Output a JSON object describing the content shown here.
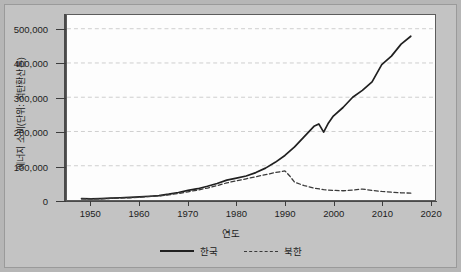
{
  "chart_data": {
    "type": "line",
    "title": "",
    "xlabel": "연도",
    "ylabel": "에너지 소비(단위: 석탄환산톤)",
    "xlim": [
      1945,
      2021
    ],
    "ylim": [
      0,
      540000
    ],
    "xticks": [
      1950,
      1960,
      1970,
      1980,
      1990,
      2000,
      2010,
      2020
    ],
    "xtick_labels": [
      "1950",
      "1960",
      "1970",
      "1980",
      "1990",
      "2000",
      "2010",
      "2020"
    ],
    "yticks": [
      0,
      100000,
      200000,
      300000,
      400000,
      500000
    ],
    "ytick_labels": [
      "0",
      "100,000",
      "200,000",
      "300,000",
      "400,000",
      "500,000"
    ],
    "grid": true,
    "grid_axis": "y",
    "legend_position": "bottom",
    "series": [
      {
        "name": "한국",
        "style": "solid",
        "color": "#202020",
        "x": [
          1948,
          1950,
          1952,
          1954,
          1956,
          1958,
          1960,
          1962,
          1964,
          1966,
          1968,
          1970,
          1972,
          1974,
          1976,
          1978,
          1980,
          1982,
          1984,
          1986,
          1988,
          1990,
          1992,
          1994,
          1996,
          1997,
          1998,
          1999,
          2000,
          2002,
          2004,
          2006,
          2008,
          2010,
          2012,
          2014,
          2016
        ],
        "y": [
          4000,
          3500,
          4200,
          5500,
          6500,
          7500,
          9000,
          11000,
          13000,
          17000,
          22000,
          28000,
          33000,
          40000,
          48000,
          58000,
          64000,
          70000,
          80000,
          93000,
          110000,
          130000,
          155000,
          185000,
          215000,
          222000,
          198000,
          225000,
          245000,
          270000,
          300000,
          320000,
          345000,
          395000,
          420000,
          455000,
          478000
        ]
      },
      {
        "name": "북한",
        "style": "dashed",
        "color": "#3a3a3a",
        "x": [
          1948,
          1950,
          1952,
          1954,
          1956,
          1958,
          1960,
          1962,
          1964,
          1966,
          1968,
          1970,
          1972,
          1974,
          1976,
          1978,
          1980,
          1982,
          1984,
          1986,
          1988,
          1990,
          1991,
          1992,
          1994,
          1996,
          1998,
          2000,
          2002,
          2004,
          2006,
          2008,
          2010,
          2012,
          2014,
          2016
        ],
        "y": [
          3500,
          3000,
          3500,
          4500,
          5500,
          6500,
          8000,
          10000,
          12000,
          15000,
          19000,
          24000,
          29000,
          35000,
          42000,
          50000,
          56000,
          62000,
          68000,
          74000,
          80000,
          85000,
          70000,
          52000,
          42000,
          35000,
          30000,
          28000,
          27000,
          29000,
          32000,
          28000,
          25000,
          23000,
          21000,
          20000
        ]
      }
    ]
  },
  "axis": {
    "ytitle": "에너지 소비(단위: 석탄환산톤)",
    "xtitle": "연도"
  },
  "legend": {
    "items": [
      {
        "label": "한국"
      },
      {
        "label": "북한"
      }
    ]
  }
}
